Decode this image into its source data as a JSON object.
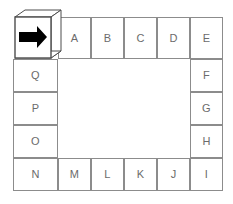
{
  "diagram": {
    "type": "ring-grid",
    "canvas": {
      "width": 233,
      "height": 204,
      "background": "#ffffff"
    },
    "style": {
      "cell_border": "#8c8c8c",
      "cell_fill": "#ffffff",
      "label_color": "#6b6b6b",
      "arrow_color": "#000000",
      "box_outline": "#4d4d4d"
    },
    "start_marker": {
      "name": "start-arrow-box",
      "shape": "isometric-cube",
      "icon": "arrow-right-icon",
      "direction": "right",
      "label": ""
    },
    "cells": [
      {
        "id": "A",
        "label": "A",
        "side": "top",
        "x": 58,
        "y": 17,
        "w": 33,
        "h": 42
      },
      {
        "id": "B",
        "label": "B",
        "side": "top",
        "x": 91,
        "y": 17,
        "w": 33,
        "h": 42
      },
      {
        "id": "C",
        "label": "C",
        "side": "top",
        "x": 124,
        "y": 17,
        "w": 33,
        "h": 42
      },
      {
        "id": "D",
        "label": "D",
        "side": "top",
        "x": 157,
        "y": 17,
        "w": 33,
        "h": 42
      },
      {
        "id": "E",
        "label": "E",
        "side": "corner-top-right",
        "x": 190,
        "y": 17,
        "w": 33,
        "h": 42
      },
      {
        "id": "F",
        "label": "F",
        "side": "right",
        "x": 190,
        "y": 59,
        "w": 33,
        "h": 33
      },
      {
        "id": "G",
        "label": "G",
        "side": "right",
        "x": 190,
        "y": 92,
        "w": 33,
        "h": 33
      },
      {
        "id": "H",
        "label": "H",
        "side": "right",
        "x": 190,
        "y": 125,
        "w": 33,
        "h": 33
      },
      {
        "id": "I",
        "label": "I",
        "side": "corner-bottom-right",
        "x": 190,
        "y": 158,
        "w": 33,
        "h": 33
      },
      {
        "id": "J",
        "label": "J",
        "side": "bottom",
        "x": 157,
        "y": 158,
        "w": 33,
        "h": 33
      },
      {
        "id": "K",
        "label": "K",
        "side": "bottom",
        "x": 124,
        "y": 158,
        "w": 33,
        "h": 33
      },
      {
        "id": "L",
        "label": "L",
        "side": "bottom",
        "x": 91,
        "y": 158,
        "w": 33,
        "h": 33
      },
      {
        "id": "M",
        "label": "M",
        "side": "bottom",
        "x": 58,
        "y": 158,
        "w": 33,
        "h": 33
      },
      {
        "id": "N",
        "label": "N",
        "side": "corner-bottom-left",
        "x": 13,
        "y": 158,
        "w": 45,
        "h": 33
      },
      {
        "id": "O",
        "label": "O",
        "side": "left",
        "x": 13,
        "y": 125,
        "w": 45,
        "h": 33
      },
      {
        "id": "P",
        "label": "P",
        "side": "left",
        "x": 13,
        "y": 92,
        "w": 45,
        "h": 33
      },
      {
        "id": "Q",
        "label": "Q",
        "side": "left",
        "x": 13,
        "y": 59,
        "w": 45,
        "h": 33
      }
    ],
    "interior": {
      "x": 58,
      "y": 59,
      "w": 132,
      "h": 99
    },
    "sequence": [
      "A",
      "B",
      "C",
      "D",
      "E",
      "F",
      "G",
      "H",
      "I",
      "J",
      "K",
      "L",
      "M",
      "N",
      "O",
      "P",
      "Q"
    ]
  }
}
